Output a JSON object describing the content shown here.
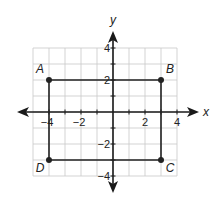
{
  "diagram": {
    "type": "coordinate-plane",
    "grid": {
      "x_min": -5,
      "x_max": 4,
      "y_min": -4,
      "y_max": 4,
      "step": 1
    },
    "axes": {
      "x_label": "x",
      "y_label": "y",
      "x_ticks": [
        {
          "value": -4,
          "label": "−4"
        },
        {
          "value": -2,
          "label": "−2"
        },
        {
          "value": 2,
          "label": "2"
        },
        {
          "value": 4,
          "label": "4"
        }
      ],
      "y_ticks": [
        {
          "value": 4,
          "label": "4"
        },
        {
          "value": 2,
          "label": "2"
        },
        {
          "value": -2,
          "label": "−2"
        },
        {
          "value": -4,
          "label": "−4"
        }
      ]
    },
    "shape": {
      "name": "rectangle ABCD",
      "points": [
        {
          "label": "A",
          "x": -4,
          "y": 2
        },
        {
          "label": "B",
          "x": 3,
          "y": 2
        },
        {
          "label": "C",
          "x": 3,
          "y": -3
        },
        {
          "label": "D",
          "x": -4,
          "y": -3
        }
      ]
    },
    "colors": {
      "grid": "#c8c8c8",
      "axis": "#1a1a1a",
      "shape": "#222222",
      "text": "#222222"
    }
  }
}
